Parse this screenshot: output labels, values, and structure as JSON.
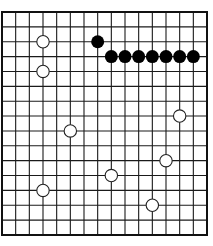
{
  "board": {
    "game": "gomoku",
    "grid_lines": 16,
    "origin_x": 2,
    "origin_y": 12,
    "width": 205,
    "height": 223,
    "line_color": "#1a1a1a",
    "border_color": "#111111",
    "background": "#ffffff",
    "black_color": "#000000",
    "white_fill": "#ffffff",
    "white_stroke": "#222222",
    "stone_radius": 6.2
  },
  "stones": {
    "black": [
      {
        "col": 7,
        "row": 2
      },
      {
        "col": 8,
        "row": 3
      },
      {
        "col": 9,
        "row": 3
      },
      {
        "col": 10,
        "row": 3
      },
      {
        "col": 11,
        "row": 3
      },
      {
        "col": 12,
        "row": 3
      },
      {
        "col": 13,
        "row": 3
      },
      {
        "col": 14,
        "row": 3
      }
    ],
    "white": [
      {
        "col": 3,
        "row": 2
      },
      {
        "col": 3,
        "row": 4
      },
      {
        "col": 13,
        "row": 7
      },
      {
        "col": 5,
        "row": 8
      },
      {
        "col": 12,
        "row": 10
      },
      {
        "col": 8,
        "row": 11
      },
      {
        "col": 3,
        "row": 12
      },
      {
        "col": 11,
        "row": 13
      }
    ]
  }
}
